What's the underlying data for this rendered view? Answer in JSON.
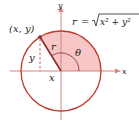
{
  "diagram": {
    "formula": {
      "lhs": "r",
      "eq": "=",
      "radicand": "x² + y²",
      "text": "r = √(x² + y²)"
    },
    "point_label": "(x, y)",
    "radius_label": "r",
    "angle_label": "θ",
    "x_leg_label": "x",
    "y_leg_label": "y",
    "x_axis_label": "x",
    "y_axis_label": "y",
    "colors": {
      "circle": "#c0392b",
      "axes": "#d98080",
      "sector_fill": "#f7c6c6",
      "segment": "#8b2a2a",
      "text": "#222222"
    }
  }
}
